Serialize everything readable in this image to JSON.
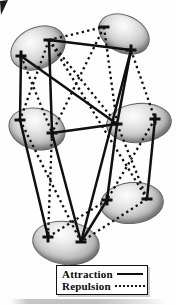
{
  "figure": {
    "ink_color": "#101010",
    "nodes": [
      {
        "id": "A",
        "cx": 37,
        "cy": 47,
        "rx": 28,
        "ry": 20,
        "rot": -25,
        "charges": [
          {
            "sign": "-",
            "x": 49,
            "y": 40
          },
          {
            "sign": "+",
            "x": 21,
            "y": 56
          }
        ]
      },
      {
        "id": "B",
        "cx": 123,
        "cy": 33,
        "rx": 26,
        "ry": 18,
        "rot": 25,
        "charges": [
          {
            "sign": "-",
            "x": 104,
            "y": 27
          },
          {
            "sign": "+",
            "x": 131,
            "y": 50
          }
        ]
      },
      {
        "id": "C",
        "cx": 36,
        "cy": 128,
        "rx": 28,
        "ry": 20,
        "rot": 14,
        "charges": [
          {
            "sign": "-",
            "x": 20,
            "y": 120
          },
          {
            "sign": "+",
            "x": 52,
            "y": 133
          }
        ]
      },
      {
        "id": "D",
        "cx": 138,
        "cy": 122,
        "rx": 32,
        "ry": 19,
        "rot": -5,
        "charges": [
          {
            "sign": "-",
            "x": 117,
            "y": 124
          },
          {
            "sign": "+",
            "x": 155,
            "y": 119
          }
        ]
      },
      {
        "id": "E",
        "cx": 131,
        "cy": 202,
        "rx": 31,
        "ry": 20,
        "rot": -5,
        "charges": [
          {
            "sign": "+",
            "x": 107,
            "y": 200
          },
          {
            "sign": "-",
            "x": 147,
            "y": 199
          }
        ]
      },
      {
        "id": "F",
        "cx": 65,
        "cy": 242,
        "rx": 33,
        "ry": 21,
        "rot": 8,
        "charges": [
          {
            "sign": "+",
            "x": 48,
            "y": 237
          },
          {
            "sign": "-",
            "x": 81,
            "y": 242
          }
        ]
      }
    ],
    "attraction_edges": [
      [
        "A-",
        "B+"
      ],
      [
        "A+",
        "C-"
      ],
      [
        "A-",
        "C+"
      ],
      [
        "A+",
        "D-"
      ],
      [
        "B+",
        "D-"
      ],
      [
        "C+",
        "D-"
      ],
      [
        "D-",
        "E+"
      ],
      [
        "D+",
        "E-"
      ],
      [
        "C-",
        "F+"
      ],
      [
        "C+",
        "F-"
      ],
      [
        "E+",
        "F-"
      ],
      [
        "B+",
        "F-"
      ]
    ],
    "repulsion_edges": [
      [
        "A-",
        "B-"
      ],
      [
        "A+",
        "C+"
      ],
      [
        "A-",
        "C-"
      ],
      [
        "B-",
        "D-"
      ],
      [
        "B+",
        "D+"
      ],
      [
        "A-",
        "D-"
      ],
      [
        "B-",
        "C+"
      ],
      [
        "C+",
        "F+"
      ],
      [
        "C-",
        "F-"
      ],
      [
        "D+",
        "E+"
      ],
      [
        "D-",
        "E-"
      ],
      [
        "E+",
        "F+"
      ],
      [
        "E-",
        "F-"
      ],
      [
        "A-",
        "E-"
      ]
    ]
  },
  "legend": {
    "attraction_label": "Attraction",
    "repulsion_label": "Repulsion"
  }
}
